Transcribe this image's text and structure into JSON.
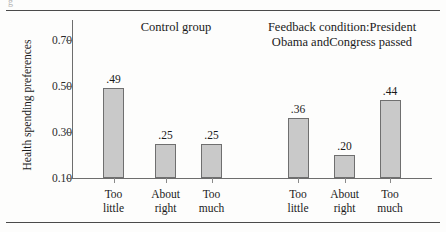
{
  "figure": {
    "stub_glyph": "g",
    "y_axis_title": "Health spending preferences"
  },
  "chart_data": {
    "type": "bar",
    "title": "",
    "xlabel": "",
    "ylabel": "Health spending preferences",
    "ylim": [
      0.1,
      0.7
    ],
    "yticks": [
      "0.10",
      "0.30",
      "0.50",
      "0.70"
    ],
    "ytick_values": [
      0.1,
      0.3,
      0.5,
      0.7
    ],
    "grid": false,
    "legend": "none",
    "bar_color": "#c9c9c9",
    "bar_edge_color": "#6f6f6f",
    "categories": [
      "Too little",
      "About right",
      "Too much"
    ],
    "panels": [
      {
        "name": "control",
        "title": "Control group",
        "title_lines": [
          "Control group"
        ],
        "categories": [
          {
            "line1": "Too",
            "line2": "little"
          },
          {
            "line1": "About",
            "line2": "right"
          },
          {
            "line1": "Too",
            "line2": "much"
          }
        ],
        "values": [
          0.49,
          0.25,
          0.25
        ],
        "labels": [
          ".49",
          ".25",
          ".25"
        ]
      },
      {
        "name": "feedback",
        "title": "Feedback condition: President Obama and Congress passed",
        "title_lines": [
          "Feedback condition:",
          "President Obama and",
          "Congress passed"
        ],
        "categories": [
          {
            "line1": "Too",
            "line2": "little"
          },
          {
            "line1": "About",
            "line2": "right"
          },
          {
            "line1": "Too",
            "line2": "much"
          }
        ],
        "values": [
          0.36,
          0.2,
          0.44
        ],
        "labels": [
          ".36",
          ".20",
          ".44"
        ]
      }
    ]
  }
}
